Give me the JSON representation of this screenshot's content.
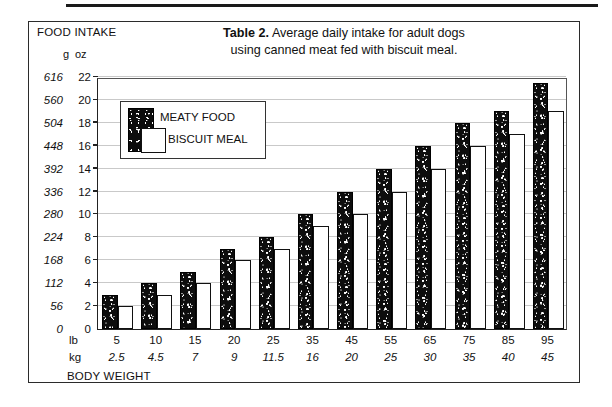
{
  "figure": {
    "title_strong": "Table 2.",
    "title_rest": " Average daily intake for adult dogs",
    "title_line2": "using canned meat fed with biscuit meal."
  },
  "axes": {
    "y_axis_title": "FOOD INTAKE",
    "y_unit_primary": "g",
    "y_unit_secondary": "oz",
    "x_axis_title": "BODY WEIGHT",
    "x_unit_primary": "lb",
    "x_unit_secondary": "kg"
  },
  "legend": {
    "meaty_label": "MEATY FOOD",
    "biscuit_label": "BISCUIT MEAL"
  },
  "chart_data": {
    "type": "bar",
    "title": "Table 2. Average daily intake for adult dogs using canned meat fed with biscuit meal.",
    "xlabel": "BODY WEIGHT",
    "ylabel": "FOOD INTAKE",
    "grid": true,
    "legend_position": "upper-left-inside",
    "categories": [
      "5",
      "10",
      "15",
      "20",
      "25",
      "35",
      "45",
      "55",
      "65",
      "75",
      "85",
      "95"
    ],
    "categories_kg": [
      "2.5",
      "4.5",
      "7",
      "9",
      "11.5",
      "16",
      "20",
      "25",
      "30",
      "35",
      "40",
      "45"
    ],
    "ylim": [
      0,
      22
    ],
    "yticks_oz": [
      0,
      2,
      4,
      6,
      8,
      10,
      12,
      14,
      16,
      18,
      20,
      22
    ],
    "yticks_g": [
      0,
      56,
      112,
      168,
      224,
      280,
      336,
      392,
      448,
      504,
      560,
      616
    ],
    "series": [
      {
        "name": "MEATY FOOD",
        "unit": "oz",
        "values": [
          3,
          4,
          5,
          7,
          8,
          10,
          12,
          14,
          16,
          18,
          19,
          21.5
        ]
      },
      {
        "name": "BISCUIT MEAL",
        "unit": "oz",
        "values": [
          2,
          3,
          4,
          6,
          7,
          9,
          10,
          12,
          14,
          16,
          17,
          19
        ]
      }
    ]
  },
  "colors": {
    "meaty": "#0d0d0d",
    "biscuit": "#ffffff",
    "grid": "#c9c9c9",
    "frame": "#2b2b2b"
  }
}
